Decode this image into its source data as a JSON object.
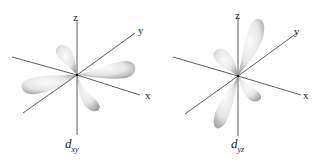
{
  "diagrams": [
    {
      "caption": "d",
      "caption_sub": "xy",
      "axes": {
        "x": "x",
        "y": "y",
        "z": "z"
      }
    },
    {
      "caption": "d",
      "caption_sub": "yz",
      "axes": {
        "x": "x",
        "y": "y",
        "z": "z"
      }
    }
  ],
  "colors": {
    "axis": "#333333",
    "lobe_light": "#f4f4f4",
    "lobe_dark": "#a8a8a8"
  }
}
